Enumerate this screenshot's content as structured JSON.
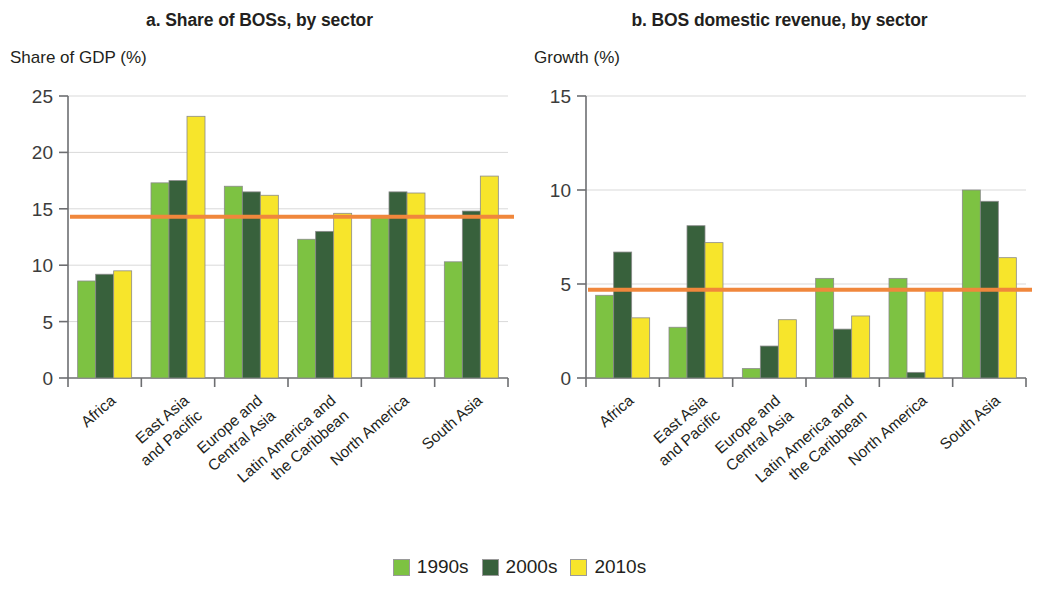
{
  "figure": {
    "legend": {
      "items": [
        {
          "label": "1990s",
          "color": "#7DC242"
        },
        {
          "label": "2000s",
          "color": "#38613C"
        },
        {
          "label": "2010s",
          "color": "#F7E52B"
        }
      ]
    }
  },
  "chart_data": [
    {
      "panel": "a",
      "type": "bar",
      "title": "a. Share of BOSs, by sector",
      "ylabel": "Share of GDP (%)",
      "xlabel": "",
      "ylim": [
        0,
        25
      ],
      "yticks": [
        0,
        5,
        10,
        15,
        20,
        25
      ],
      "ytick_labels": [
        "0",
        "5",
        "10",
        "15",
        "20",
        "25"
      ],
      "grid": true,
      "legend_position": "bottom",
      "categories": [
        "Africa",
        "East Asia and Pacific",
        "Europe and Central Asia",
        "Latin America and the Caribbean",
        "North America",
        "South Asia"
      ],
      "category_lines": [
        [
          "Africa"
        ],
        [
          "East Asia",
          "and Pacific"
        ],
        [
          "Europe and",
          "Central Asia"
        ],
        [
          "Latin America and",
          "the Caribbean"
        ],
        [
          "North America"
        ],
        [
          "South Asia"
        ]
      ],
      "series": [
        {
          "name": "1990s",
          "color": "#7DC242",
          "values": [
            8.6,
            17.3,
            17.0,
            12.3,
            14.3,
            10.3
          ]
        },
        {
          "name": "2000s",
          "color": "#38613C",
          "values": [
            9.2,
            17.5,
            16.5,
            13.0,
            16.5,
            14.8
          ]
        },
        {
          "name": "2010s",
          "color": "#F7E52B",
          "values": [
            9.5,
            23.2,
            16.2,
            14.6,
            16.4,
            17.9
          ]
        }
      ],
      "reference_line": {
        "value": 14.3,
        "color": "#F0873C"
      }
    },
    {
      "panel": "b",
      "type": "bar",
      "title": "b. BOS domestic revenue, by sector",
      "ylabel": "Growth (%)",
      "xlabel": "",
      "ylim": [
        0,
        15
      ],
      "yticks": [
        0,
        5,
        10,
        15
      ],
      "ytick_labels": [
        "0",
        "5",
        "10",
        "15"
      ],
      "grid": true,
      "legend_position": "bottom",
      "categories": [
        "Africa",
        "East Asia and Pacific",
        "Europe and Central Asia",
        "Latin America and the Caribbean",
        "North America",
        "South Asia"
      ],
      "category_lines": [
        [
          "Africa"
        ],
        [
          "East Asia",
          "and Pacific"
        ],
        [
          "Europe and",
          "Central Asia"
        ],
        [
          "Latin America and",
          "the Caribbean"
        ],
        [
          "North America"
        ],
        [
          "South Asia"
        ]
      ],
      "series": [
        {
          "name": "1990s",
          "color": "#7DC242",
          "values": [
            4.4,
            2.7,
            0.5,
            5.3,
            5.3,
            10.0
          ]
        },
        {
          "name": "2000s",
          "color": "#38613C",
          "values": [
            6.7,
            8.1,
            1.7,
            2.6,
            0.3,
            9.4
          ]
        },
        {
          "name": "2010s",
          "color": "#F7E52B",
          "values": [
            3.2,
            7.2,
            3.1,
            3.3,
            4.7,
            6.4
          ]
        }
      ],
      "reference_line": {
        "value": 4.7,
        "color": "#F0873C"
      }
    }
  ]
}
